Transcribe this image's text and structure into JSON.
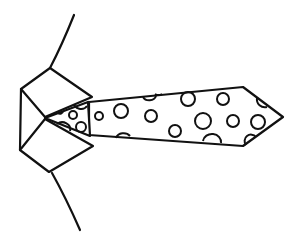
{
  "illustration": {
    "subject": "polka-dot necktie with shirt collar",
    "style": "black line drawing on white",
    "colors": {
      "line": "#111111",
      "background": "#ffffff"
    }
  }
}
